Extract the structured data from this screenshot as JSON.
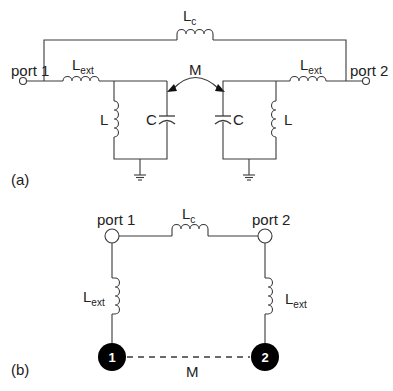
{
  "panel_a": {
    "label": "(a)",
    "port1": "port 1",
    "port2": "port 2",
    "coupling_inductor": {
      "main": "L",
      "sub": "c"
    },
    "ext_left": {
      "main": "L",
      "sub": "ext"
    },
    "ext_right": {
      "main": "L",
      "sub": "ext"
    },
    "mutual": "M",
    "left_tank": {
      "inductor": "L",
      "capacitor": "C"
    },
    "right_tank": {
      "inductor": "L",
      "capacitor": "C"
    }
  },
  "panel_b": {
    "label": "(b)",
    "port1": "port 1",
    "port2": "port 2",
    "coupling_inductor": {
      "main": "L",
      "sub": "c"
    },
    "ext_left": {
      "main": "L",
      "sub": "ext"
    },
    "ext_right": {
      "main": "L",
      "sub": "ext"
    },
    "node1": "1",
    "node2": "2",
    "mutual": "M"
  },
  "colors": {
    "line": "#3a3a3a",
    "node_fill": "#000000",
    "text": "#222222"
  }
}
